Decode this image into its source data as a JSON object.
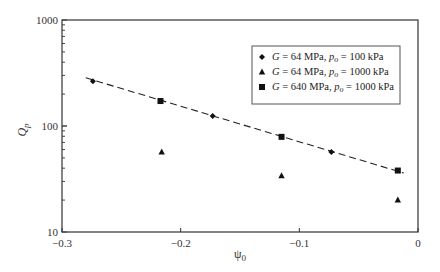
{
  "chart_data": {
    "type": "scatter",
    "title": "",
    "xlabel": "ψ0",
    "ylabel": "Qp",
    "xlim": [
      -0.3,
      0
    ],
    "ylim": [
      10,
      1000
    ],
    "yscale": "log",
    "grid": false,
    "legend_position": "upper right (inside)",
    "x_ticks": [
      -0.3,
      -0.2,
      -0.1,
      0
    ],
    "x_tick_labels": [
      "−0.3",
      "−0.2",
      "−0.1",
      "0"
    ],
    "y_ticks": [
      10,
      100,
      1000
    ],
    "y_tick_labels": [
      "10",
      "100",
      "1000"
    ],
    "series": [
      {
        "name": "G = 64 MPa, po = 100 kPa",
        "marker": "diamond",
        "x": [
          -0.274,
          -0.173,
          -0.073
        ],
        "y": [
          265,
          124,
          57
        ]
      },
      {
        "name": "G = 64 MPa, po = 1000 kPa",
        "marker": "triangle",
        "x": [
          -0.216,
          -0.115,
          -0.017
        ],
        "y": [
          57,
          34,
          20
        ]
      },
      {
        "name": "G = 640 MPa, po = 1000 kPa",
        "marker": "square",
        "x": [
          -0.217,
          -0.115,
          -0.017
        ],
        "y": [
          172,
          79,
          38
        ]
      }
    ],
    "fit_line": {
      "style": "dashed",
      "x": [
        -0.28,
        -0.012
      ],
      "y": [
        285,
        36
      ]
    }
  },
  "legend": {
    "items": [
      {
        "g": "G",
        "g_val": " = 64 MPa, ",
        "p": "p",
        "sub": "o",
        "p_val": " = 100 kPa",
        "marker": "diamond"
      },
      {
        "g": "G",
        "g_val": " = 64 MPa, ",
        "p": "p",
        "sub": "o",
        "p_val": " = 1000 kPa",
        "marker": "triangle"
      },
      {
        "g": "G",
        "g_val": " = 640 MPa, ",
        "p": "p",
        "sub": "o",
        "p_val": " = 1000 kPa",
        "marker": "square"
      }
    ]
  },
  "axes": {
    "x_title_main": "ψ",
    "x_title_sub": "0",
    "y_title_main": "Q",
    "y_title_sub": "p"
  }
}
